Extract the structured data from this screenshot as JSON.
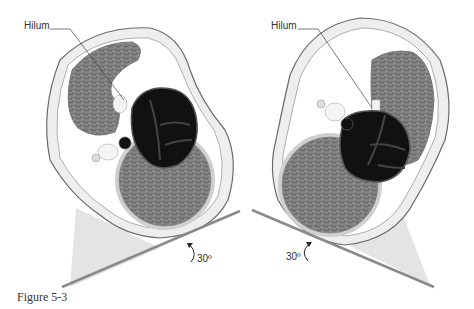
{
  "figure": {
    "caption": "Figure 5-3",
    "panels": [
      {
        "id": "left",
        "label": "Hilum",
        "angle_label": "30º",
        "orientation": "tilted right side up"
      },
      {
        "id": "right",
        "label": "Hilum",
        "angle_label": "30º",
        "orientation": "tilted left side up"
      }
    ],
    "colors": {
      "organ_tissue": "#7a7a7a",
      "dark_structure": "#111111",
      "outline": "#6a6a6a",
      "body_wall": "#e8e8e8",
      "wedge": "#e4e4e4",
      "table": "#8a8a8a"
    }
  }
}
